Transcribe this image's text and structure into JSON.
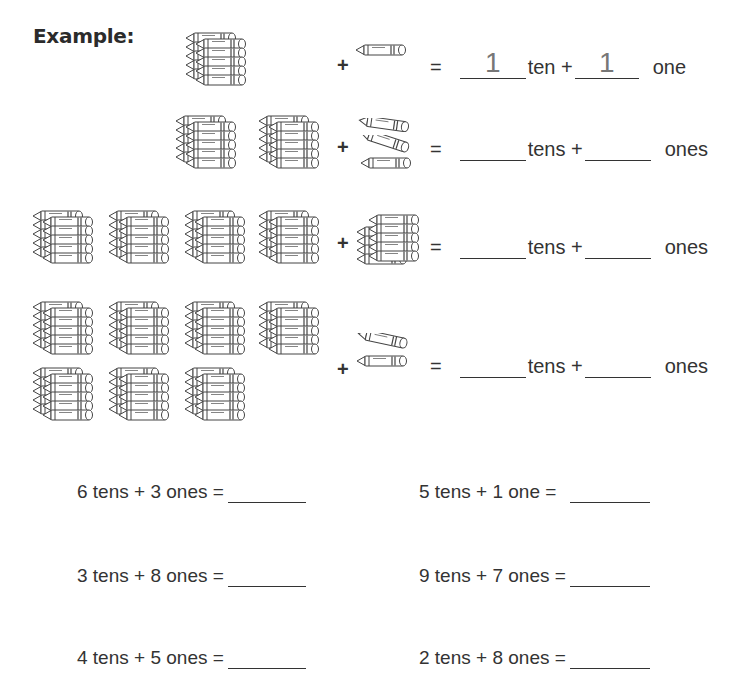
{
  "title": "Example:",
  "example_row": {
    "tens_bundles": 1,
    "loose_ones": 1,
    "plus": "+",
    "equals": "=",
    "tens_answer": "1",
    "tens_unit": "ten +",
    "ones_answer": "1",
    "ones_unit": "one"
  },
  "rows": [
    {
      "tens_bundles": 2,
      "loose_ones": 3,
      "plus": "+",
      "equals": "=",
      "tens_answer": "",
      "tens_unit": "tens +",
      "ones_answer": "",
      "ones_unit": "ones"
    },
    {
      "tens_bundles": 4,
      "loose_ones": 9,
      "plus": "+",
      "equals": "=",
      "tens_answer": "",
      "tens_unit": "tens +",
      "ones_answer": "",
      "ones_unit": "ones"
    },
    {
      "tens_bundles": 7,
      "loose_ones": 2,
      "plus": "+",
      "equals": "=",
      "tens_answer": "",
      "tens_unit": "tens +",
      "ones_answer": "",
      "ones_unit": "ones"
    }
  ],
  "problems": [
    {
      "text": "6 tens + 3 ones =",
      "answer": ""
    },
    {
      "text": "5 tens + 1 one =",
      "answer": ""
    },
    {
      "text": "3 tens + 8 ones =",
      "answer": ""
    },
    {
      "text": "9 tens + 7 ones =",
      "answer": ""
    },
    {
      "text": "4 tens + 5 ones =",
      "answer": ""
    },
    {
      "text": "2 tens + 8 ones =",
      "answer": ""
    }
  ],
  "icons": {
    "bundle": "crayon-bundle-of-ten-icon",
    "single": "single-crayon-icon"
  }
}
